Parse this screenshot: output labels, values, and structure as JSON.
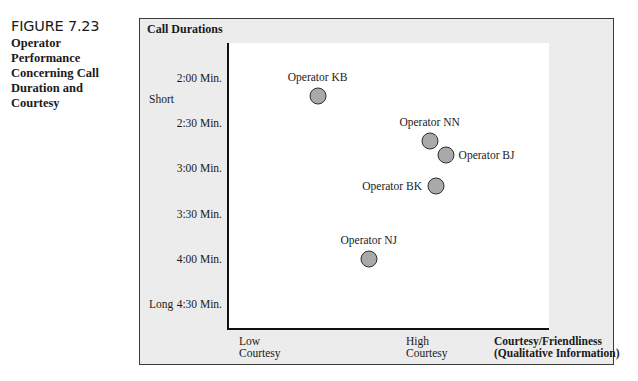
{
  "caption": {
    "figure_number": "FIGURE 7.23",
    "title_lines": [
      "Operator",
      "Performance",
      "Concerning Call",
      "Duration and",
      "Courtesy"
    ]
  },
  "chart_data": {
    "type": "scatter",
    "title": "Operator Performance Concerning Call Duration and Courtesy",
    "ylabel": "Call Durations",
    "xlabel": "Courtesy/Friendliness (Qualitative Information)",
    "y_ticks": [
      "2:00 Min.",
      "2:30 Min.",
      "3:00 Min.",
      "3:30 Min.",
      "4:00 Min.",
      "4:30 Min."
    ],
    "y_tick_values_min": [
      2.0,
      2.5,
      3.0,
      3.5,
      4.0,
      4.5
    ],
    "y_axis_inverted": true,
    "y_category_labels": [
      {
        "label": "Short",
        "near": "2:15 Min."
      },
      {
        "label": "Long",
        "near": "4:30 Min."
      }
    ],
    "x_tick_labels": [
      {
        "line1": "Low",
        "line2": "Courtesy",
        "position": 0.03
      },
      {
        "line1": "High",
        "line2": "Courtesy",
        "position": 0.55
      }
    ],
    "x_title_lines": [
      "Courtesy/Friendliness",
      "(Qualitative Information)"
    ],
    "xlim": [
      0,
      1
    ],
    "ylim": [
      1.75,
      4.9
    ],
    "grid": false,
    "legend": null,
    "points": [
      {
        "name": "Operator KB",
        "courtesy": 0.28,
        "duration_min": 2.2,
        "label_pos": "above"
      },
      {
        "name": "Operator NN",
        "courtesy": 0.63,
        "duration_min": 2.7,
        "label_pos": "above"
      },
      {
        "name": "Operator BJ",
        "courtesy": 0.68,
        "duration_min": 2.85,
        "label_pos": "right"
      },
      {
        "name": "Operator BK",
        "courtesy": 0.65,
        "duration_min": 3.2,
        "label_pos": "left"
      },
      {
        "name": "Operator NJ",
        "courtesy": 0.44,
        "duration_min": 4.0,
        "label_pos": "above"
      }
    ],
    "colors": {
      "marker_fill": "#a9a9a9",
      "marker_edge": "#2e2e2e",
      "panel_bg": "#ececec",
      "plot_bg": "#ffffff"
    }
  }
}
